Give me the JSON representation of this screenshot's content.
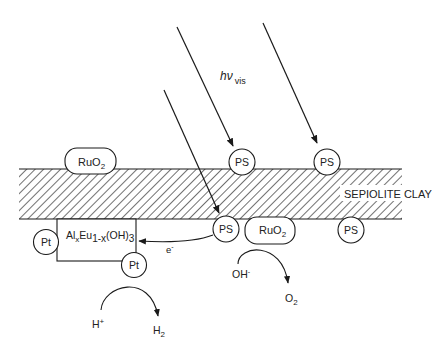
{
  "diagram": {
    "light_label": {
      "main": "hν",
      "sub": "vis"
    },
    "clay_label": "SEPIOLITE CLAY",
    "particles": {
      "ruo2_top": {
        "main": "RuO",
        "sub": "2"
      },
      "ruo2_bottom": {
        "main": "RuO",
        "sub": "2"
      },
      "ps_top_1": "PS",
      "ps_top_2": "PS",
      "ps_bottom_1": "PS",
      "ps_bottom_2": "PS",
      "pt_left": "Pt",
      "pt_right": "Pt"
    },
    "catalyst_box": {
      "part1": "Al",
      "sub1": "x",
      "part2": "Eu",
      "sub2": "1-x",
      "part3": "(OH)",
      "sub3": "3"
    },
    "electron": {
      "main": "e",
      "sup": "-"
    },
    "hydroxide": {
      "main": "OH",
      "sup": "-"
    },
    "oxygen": {
      "main": "O",
      "sub": "2"
    },
    "proton": {
      "main": "H",
      "sup": "+"
    },
    "hydrogen": {
      "main": "H",
      "sub": "2"
    }
  },
  "colors": {
    "stroke": "#1a1a1a",
    "hatch": "#333333",
    "background": "#ffffff"
  }
}
